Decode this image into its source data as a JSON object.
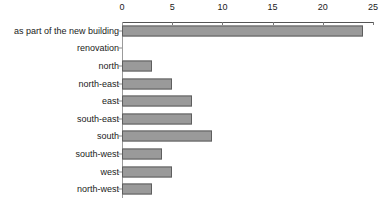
{
  "chart_data": {
    "type": "bar",
    "orientation": "horizontal",
    "title": "",
    "xlabel": "",
    "ylabel": "",
    "xlim": [
      0,
      25
    ],
    "ticks": [
      0,
      5,
      10,
      15,
      20,
      25
    ],
    "tick_labels": [
      "0",
      "5",
      "10",
      "15",
      "20",
      "25"
    ],
    "grid": false,
    "legend": "none",
    "axis_position": "top",
    "categories": [
      "as part of the new building",
      "renovation",
      "north",
      "north-east",
      "east",
      "south-east",
      "south",
      "south-west",
      "west",
      "north-west"
    ],
    "values": [
      24,
      0,
      3,
      5,
      7,
      7,
      9,
      4,
      5,
      3
    ],
    "bar_fill_color": "#9a9a9a",
    "bar_border_color": "#5e5e5e",
    "axis_color": "#555555",
    "text_color": "#1a1a1a",
    "background_color": "#ffffff"
  }
}
